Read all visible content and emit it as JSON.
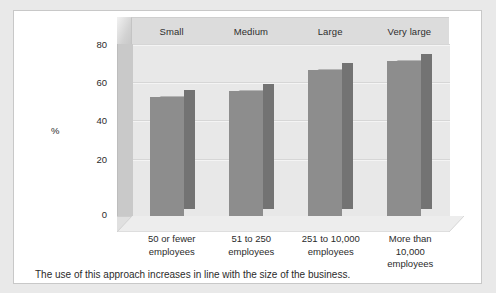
{
  "figure": {
    "caption": "The use of this approach increases in line with the size of the business."
  },
  "chart_data": {
    "type": "bar",
    "title": "",
    "xlabel": "",
    "ylabel": "%",
    "ylim": [
      0,
      90
    ],
    "yticks": [
      "0",
      "20",
      "40",
      "60",
      "80"
    ],
    "grid": true,
    "legend": false,
    "style": "3d-column",
    "categories": [
      "50 or fewer employees",
      "51 to 250 employees",
      "251 to 10,000 employees",
      "More than 10,000 employees"
    ],
    "category_headers": [
      "Small",
      "Medium",
      "Large",
      "Very large"
    ],
    "category_lines": [
      [
        "50 or fewer",
        "employees"
      ],
      [
        "51 to 250",
        "employees"
      ],
      [
        "251 to 10,000",
        "employees"
      ],
      [
        "More than",
        "10,000",
        "employees"
      ]
    ],
    "values": [
      66,
      69,
      80,
      85
    ],
    "colors": {
      "bar_front": "#8d8d8d",
      "bar_side": "#737373",
      "bar_top": "#b4b4b4",
      "plot_background": "#e8e8e8",
      "header_band": "#dcdcdc",
      "panel": "#ffffff",
      "page_background": "#e9e9e9"
    }
  }
}
